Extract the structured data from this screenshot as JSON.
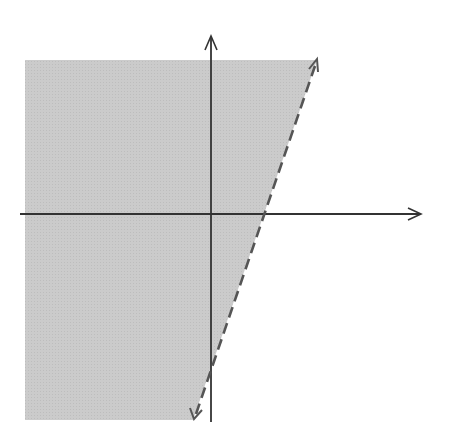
{
  "chart_data": {
    "type": "line",
    "title": "",
    "annotation": "6x − 2y < 12",
    "xlabel": "x",
    "ylabel": "y",
    "xlim": [
      -7,
      7
    ],
    "ylim": [
      -8,
      6
    ],
    "grid": true,
    "x_ticks": [
      "−6",
      "−5",
      "−4",
      "−3",
      "−2",
      "−1",
      "1",
      "3",
      "4",
      "5",
      "6"
    ],
    "y_ticks": [
      "5",
      "4",
      "3",
      "2",
      "1",
      "−1",
      "−2",
      "−3",
      "−4",
      "−5"
    ],
    "boundary_line": {
      "equation": "y = 3x − 6",
      "style": "dashed",
      "points": [
        [
          -0.67,
          -8
        ],
        [
          4,
          6
        ]
      ],
      "x_intercept": 2,
      "y_intercept": -6
    },
    "shaded_region": "left of / above boundary (6x − 2y < 12)",
    "colors": {
      "shade": "#c9c9c9",
      "grid": "#9a9a9a",
      "axis": "#333333",
      "boundary": "#555555"
    }
  }
}
